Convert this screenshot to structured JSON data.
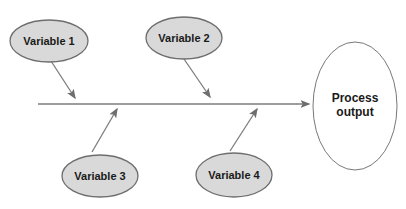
{
  "diagram": {
    "type": "cause-and-effect-diagram",
    "nodes": {
      "variable1": {
        "label": "Variable 1"
      },
      "variable2": {
        "label": "Variable 2"
      },
      "variable3": {
        "label": "Variable 3"
      },
      "variable4": {
        "label": "Variable 4"
      },
      "process_output": {
        "label": "Process output",
        "label_lines": [
          "Process",
          "output"
        ]
      }
    },
    "colors": {
      "background": "#ffffff",
      "node_fill": "#d9d9d9",
      "node_stroke": "#6e6e6e",
      "output_fill": "#ffffff",
      "output_stroke": "#787878",
      "arrow": "#7d7d7d",
      "arrowhead": "#6e6e6e",
      "text": "#1a1a1a"
    }
  }
}
